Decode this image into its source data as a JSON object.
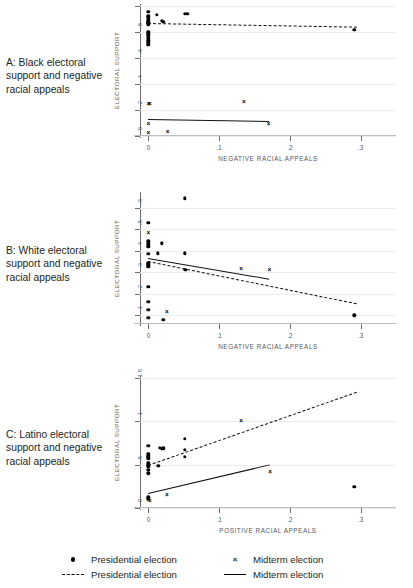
{
  "figure": {
    "panels": [
      {
        "id": "A",
        "caption": "A: Black electoral support and negative racial appeals",
        "chart_data": {
          "type": "scatter",
          "title": "A: Black electoral support and negative racial appeals",
          "xlabel": "NEGATIVE RACIAL APPEALS",
          "ylabel": "ELECTORAL SUPPORT",
          "xlim": [
            -0.012,
            0.35
          ],
          "ylim": [
            0,
            1
          ],
          "xticks": [
            0,
            0.1,
            0.2,
            0.3
          ],
          "xticklabels": [
            "0",
            ".1",
            ".2",
            ".3"
          ],
          "yticks": [
            0,
            0.2,
            0.4,
            0.6,
            0.8,
            1
          ],
          "yticklabels": [
            "0",
            ".2",
            ".4",
            ".6",
            ".8",
            "1"
          ],
          "grid": "horizontal",
          "series": [
            {
              "name": "Presidential election",
              "marker": "dot",
              "points": [
                [
                  0.0,
                  0.955
                ],
                [
                  0.0,
                  0.925
                ],
                [
                  0.0,
                  0.915
                ],
                [
                  0.0,
                  0.9
                ],
                [
                  0.0,
                  0.885
                ],
                [
                  0.0,
                  0.875
                ],
                [
                  0.0,
                  0.87
                ],
                [
                  0.0,
                  0.86
                ],
                [
                  0.0,
                  0.8
                ],
                [
                  0.0,
                  0.79
                ],
                [
                  0.0,
                  0.775
                ],
                [
                  0.0,
                  0.755
                ],
                [
                  0.0,
                  0.735
                ],
                [
                  0.0,
                  0.725
                ],
                [
                  0.0,
                  0.71
                ],
                [
                  0.0,
                  0.7
                ],
                [
                  0.012,
                  0.93
                ],
                [
                  0.019,
                  0.885
                ],
                [
                  0.021,
                  0.878
                ],
                [
                  0.051,
                  0.94
                ],
                [
                  0.055,
                  0.94
                ],
                [
                  0.291,
                  0.818
                ]
              ]
            },
            {
              "name": "Midterm election",
              "marker": "x",
              "points": [
                [
                  0.0,
                  0.25
                ],
                [
                  0.002,
                  0.245
                ],
                [
                  0.135,
                  0.262
                ],
                [
                  0.0,
                  0.09
                ],
                [
                  0.17,
                  0.09
                ],
                [
                  0.0,
                  0.022
                ],
                [
                  0.027,
                  0.028
                ]
              ]
            },
            {
              "name": "Presidential election",
              "marker": "dashed-line",
              "line": [
                [
                  0.0,
                  0.866
                ],
                [
                  0.295,
                  0.838
                ]
              ]
            },
            {
              "name": "Midterm election",
              "marker": "solid-line",
              "line": [
                [
                  0.0,
                  0.133
                ],
                [
                  0.171,
                  0.118
                ]
              ]
            }
          ]
        }
      },
      {
        "id": "B",
        "caption": "B: White electoral support and negative racial appeals",
        "chart_data": {
          "type": "scatter",
          "title": "B: White electoral support and negative racial appeals",
          "xlabel": "NEGATIVE RACIAL APPEALS",
          "ylabel": "ELECTORAL SUPPORT",
          "xlim": [
            -0.012,
            0.35
          ],
          "ylim": [
            0.06,
            0.665
          ],
          "xticks": [
            0,
            0.1,
            0.2,
            0.3
          ],
          "xticklabels": [
            "0",
            ".1",
            ".2",
            ".3"
          ],
          "yticks": [
            0.1,
            0.2,
            0.3,
            0.4,
            0.5,
            0.6
          ],
          "yticklabels": [
            ".1",
            ".2",
            ".3",
            ".4",
            ".5",
            ".6"
          ],
          "grid": "horizontal",
          "series": [
            {
              "name": "Presidential election",
              "marker": "dot",
              "points": [
                [
                  0.051,
                  0.645
                ],
                [
                  0.0,
                  0.53
                ],
                [
                  0.0,
                  0.445
                ],
                [
                  0.0,
                  0.432
                ],
                [
                  0.0,
                  0.425
                ],
                [
                  0.0,
                  0.418
                ],
                [
                  0.019,
                  0.435
                ],
                [
                  0.0,
                  0.388
                ],
                [
                  0.013,
                  0.389
                ],
                [
                  0.051,
                  0.389
                ],
                [
                  0.0,
                  0.345
                ],
                [
                  0.0,
                  0.338
                ],
                [
                  0.0,
                  0.332
                ],
                [
                  0.0,
                  0.325
                ],
                [
                  0.052,
                  0.312
                ],
                [
                  0.0,
                  0.232
                ],
                [
                  0.0,
                  0.164
                ],
                [
                  0.0,
                  0.125
                ],
                [
                  0.0,
                  0.088
                ],
                [
                  0.021,
                  0.079
                ],
                [
                  0.291,
                  0.1
                ]
              ]
            },
            {
              "name": "Midterm election",
              "marker": "x",
              "points": [
                [
                  0.0,
                  0.483
                ],
                [
                  0.0,
                  0.333
                ],
                [
                  0.131,
                  0.318
                ],
                [
                  0.171,
                  0.311
                ],
                [
                  0.026,
                  0.118
                ]
              ]
            },
            {
              "name": "Presidential election",
              "marker": "dashed-line",
              "line": [
                [
                  0.0,
                  0.352
                ],
                [
                  0.295,
                  0.155
                ]
              ]
            },
            {
              "name": "Midterm election",
              "marker": "solid-line",
              "line": [
                [
                  0.0,
                  0.368
                ],
                [
                  0.171,
                  0.272
                ]
              ]
            }
          ]
        }
      },
      {
        "id": "C",
        "caption": "C: Latino electoral support and negative racial appeals",
        "chart_data": {
          "type": "scatter",
          "title": "C: Latino electoral support and negative racial appeals",
          "xlabel": "POSITIVE RACIAL APPEALS",
          "ylabel": "ELECTORAL SUPPORT",
          "xlim": [
            -0.012,
            0.35
          ],
          "ylim": [
            0,
            1.5
          ],
          "xticks": [
            0,
            0.1,
            0.2,
            0.3
          ],
          "xticklabels": [
            "0",
            ".1",
            ".2",
            ".3"
          ],
          "yticks": [
            0,
            0.5,
            1,
            1.5
          ],
          "yticklabels": [
            "0",
            ".5",
            "1",
            "1.5"
          ],
          "grid": "horizontal",
          "series": [
            {
              "name": "Presidential election",
              "marker": "dot",
              "points": [
                [
                  0.051,
                  0.8
                ],
                [
                  0.0,
                  0.72
                ],
                [
                  0.016,
                  0.695
                ],
                [
                  0.019,
                  0.685
                ],
                [
                  0.021,
                  0.69
                ],
                [
                  0.051,
                  0.675
                ],
                [
                  0.0,
                  0.625
                ],
                [
                  0.0,
                  0.605
                ],
                [
                  0.0,
                  0.59
                ],
                [
                  0.0,
                  0.575
                ],
                [
                  0.051,
                  0.59
                ],
                [
                  0.0,
                  0.52
                ],
                [
                  0.0,
                  0.495
                ],
                [
                  0.0,
                  0.48
                ],
                [
                  0.014,
                  0.49
                ],
                [
                  0.0,
                  0.44
                ],
                [
                  0.0,
                  0.4
                ],
                [
                  0.0,
                  0.125
                ],
                [
                  0.0,
                  0.105
                ],
                [
                  0.291,
                  0.245
                ]
              ]
            },
            {
              "name": "Midterm election",
              "marker": "x",
              "points": [
                [
                  0.131,
                  1.0
                ],
                [
                  0.172,
                  0.41
                ],
                [
                  0.026,
                  0.15
                ],
                [
                  0.0,
                  0.09
                ],
                [
                  0.002,
                  0.085
                ]
              ]
            },
            {
              "name": "Presidential election",
              "marker": "dashed-line",
              "line": [
                [
                  0.0,
                  0.5
                ],
                [
                  0.295,
                  1.345
                ]
              ]
            },
            {
              "name": "Midterm election",
              "marker": "solid-line",
              "line": [
                [
                  0.0,
                  0.175
                ],
                [
                  0.172,
                  0.505
                ]
              ]
            }
          ]
        }
      }
    ],
    "legend": {
      "items": [
        {
          "symbol": "dot",
          "label": "Presidential election"
        },
        {
          "symbol": "dashed-line",
          "label": "Presidential election"
        },
        {
          "symbol": "x",
          "label": "Midterm election"
        },
        {
          "symbol": "solid-line",
          "label": "Midterm election"
        }
      ],
      "x_glyph": "×"
    }
  }
}
